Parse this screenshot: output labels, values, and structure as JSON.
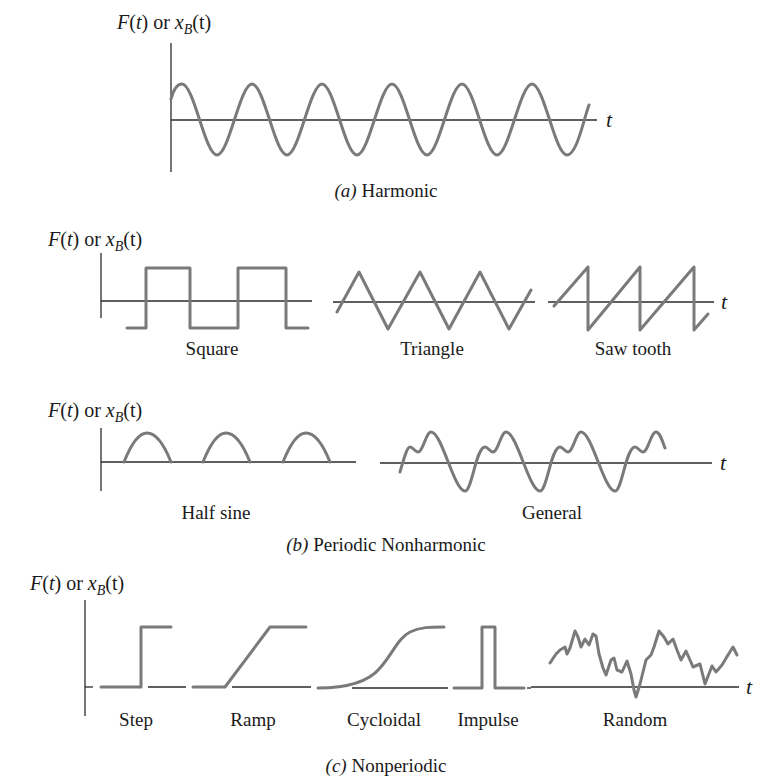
{
  "figure": {
    "y_axis_label": {
      "f": "F",
      "t_open": "(",
      "t": "t",
      "t_close": ")",
      "or": " or ",
      "x": "x",
      "sub": "B",
      "t2": "(t)"
    },
    "time_axis_label": "t",
    "panels": {
      "a": {
        "caption_letter": "(a)",
        "caption_text": " Harmonic",
        "waves": [
          "Harmonic"
        ]
      },
      "b": {
        "caption_letter": "(b)",
        "caption_text": " Periodic Nonharmonic",
        "row1": [
          "Square",
          "Triangle",
          "Saw tooth"
        ],
        "row2": [
          "Half sine",
          "General"
        ]
      },
      "c": {
        "caption_letter": "(c)",
        "caption_text": " Nonperiodic",
        "waves": [
          "Step",
          "Ramp",
          "Cycloidal",
          "Impulse",
          "Random"
        ]
      }
    },
    "colors": {
      "waveform": "#7a7a7a",
      "axis": "#2a2a2a",
      "text": "#1a1a1a"
    }
  }
}
